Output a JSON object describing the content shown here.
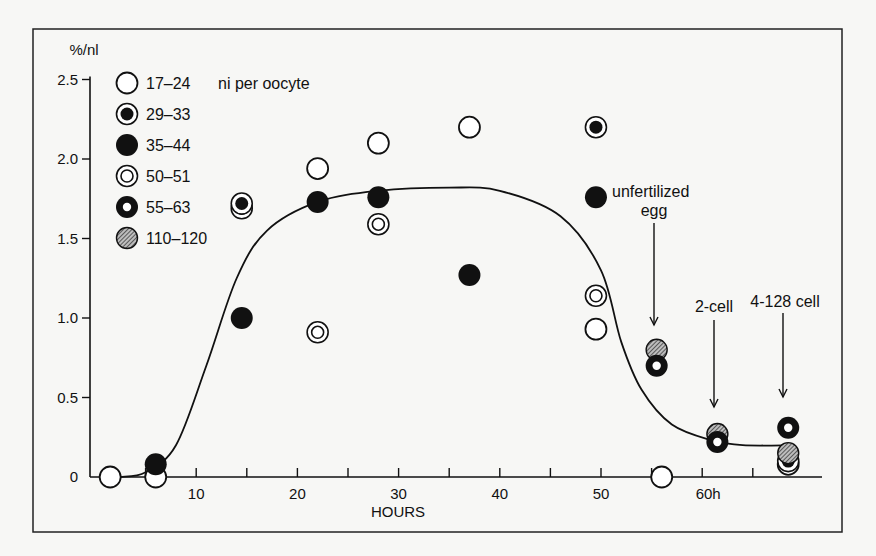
{
  "chart_data": {
    "type": "scatter",
    "title": "",
    "xlabel": "HOURS",
    "ylabel": "%/nl",
    "xlim": [
      0,
      73
    ],
    "ylim": [
      0,
      2.5
    ],
    "x_ticks": [
      5,
      10,
      15,
      20,
      25,
      30,
      35,
      40,
      45,
      50,
      55,
      60,
      65
    ],
    "x_tick_labels": [
      {
        "x": 10,
        "label": "10"
      },
      {
        "x": 20,
        "label": "20"
      },
      {
        "x": 30,
        "label": "30"
      },
      {
        "x": 40,
        "label": "40"
      },
      {
        "x": 50,
        "label": "50"
      },
      {
        "x": 60,
        "label": "60h"
      }
    ],
    "y_ticks": [
      {
        "y": 0,
        "label": "0"
      },
      {
        "y": 0.5,
        "label": "0.5"
      },
      {
        "y": 1.0,
        "label": "1.0"
      },
      {
        "y": 1.5,
        "label": "1.5"
      },
      {
        "y": 2.0,
        "label": "2.0"
      },
      {
        "y": 2.5,
        "label": "2.5"
      }
    ],
    "grid": false,
    "legend": {
      "position": "upper-left",
      "title": "ni per oocyte",
      "entries": [
        {
          "key": "open",
          "label": "17–24"
        },
        {
          "key": "ring_filled_center",
          "label": "29–33"
        },
        {
          "key": "filled",
          "label": "35–44"
        },
        {
          "key": "double_ring",
          "label": "50–51"
        },
        {
          "key": "thick_ring",
          "label": "55–63"
        },
        {
          "key": "hatched",
          "label": "110–120"
        }
      ]
    },
    "series": [
      {
        "name": "17–24",
        "key": "open",
        "points": [
          [
            1.5,
            0
          ],
          [
            6,
            0
          ],
          [
            22,
            1.94
          ],
          [
            28,
            2.1
          ],
          [
            37,
            2.2
          ],
          [
            49.5,
            0.93
          ],
          [
            56,
            0
          ],
          [
            68.5,
            0.08
          ]
        ]
      },
      {
        "name": "29–33",
        "key": "ring_filled_center",
        "points": [
          [
            14.5,
            1.72
          ],
          [
            49.5,
            2.2
          ],
          [
            68.5,
            0.1
          ]
        ]
      },
      {
        "name": "35–44",
        "key": "filled",
        "points": [
          [
            6,
            0.08
          ],
          [
            14.5,
            1.0
          ],
          [
            22,
            1.73
          ],
          [
            28,
            1.76
          ],
          [
            37,
            1.27
          ],
          [
            49.5,
            1.76
          ]
        ]
      },
      {
        "name": "50–51",
        "key": "double_ring",
        "points": [
          [
            14.5,
            1.69
          ],
          [
            22,
            0.91
          ],
          [
            28,
            1.59
          ],
          [
            49.5,
            1.14
          ]
        ]
      },
      {
        "name": "55–63",
        "key": "thick_ring",
        "points": [
          [
            55.5,
            0.7
          ],
          [
            61.5,
            0.22
          ],
          [
            68.5,
            0.31
          ]
        ]
      },
      {
        "name": "110–120",
        "key": "hatched",
        "points": [
          [
            55.5,
            0.8
          ],
          [
            61.5,
            0.27
          ],
          [
            68.5,
            0.15
          ]
        ]
      }
    ],
    "fit_curve": {
      "description": "smooth sigmoid rise to plateau ~1.8 then fall to ~0.2",
      "points": [
        [
          2.5,
          0
        ],
        [
          5,
          0.03
        ],
        [
          8,
          0.2
        ],
        [
          11,
          0.7
        ],
        [
          14,
          1.25
        ],
        [
          17,
          1.55
        ],
        [
          22,
          1.73
        ],
        [
          28,
          1.8
        ],
        [
          35,
          1.82
        ],
        [
          40,
          1.8
        ],
        [
          46,
          1.64
        ],
        [
          50,
          1.3
        ],
        [
          52,
          0.85
        ],
        [
          54,
          0.55
        ],
        [
          57,
          0.33
        ],
        [
          61,
          0.23
        ],
        [
          64,
          0.2
        ],
        [
          69,
          0.2
        ]
      ]
    },
    "annotations": [
      {
        "text_lines": [
          "unfertilized",
          "egg"
        ],
        "arrow_x": 55.5,
        "arrow_from_y": 1.55,
        "arrow_to_y": 0.92
      },
      {
        "text_lines": [
          "2-cell"
        ],
        "arrow_x": 61.5,
        "arrow_from_y": 0.9,
        "arrow_to_y": 0.35
      },
      {
        "text_lines": [
          "4-128 cell"
        ],
        "arrow_x": 68.5,
        "arrow_from_y": 0.9,
        "arrow_to_y": 0.42
      }
    ]
  },
  "labels": {
    "ylabel": "%/nl",
    "xlabel": "HOURS",
    "legend_title": "ni per oocyte",
    "ann_unfert_1": "unfertilized",
    "ann_unfert_2": "egg",
    "ann_2cell": "2-cell",
    "ann_4cell": "4-128 cell"
  }
}
